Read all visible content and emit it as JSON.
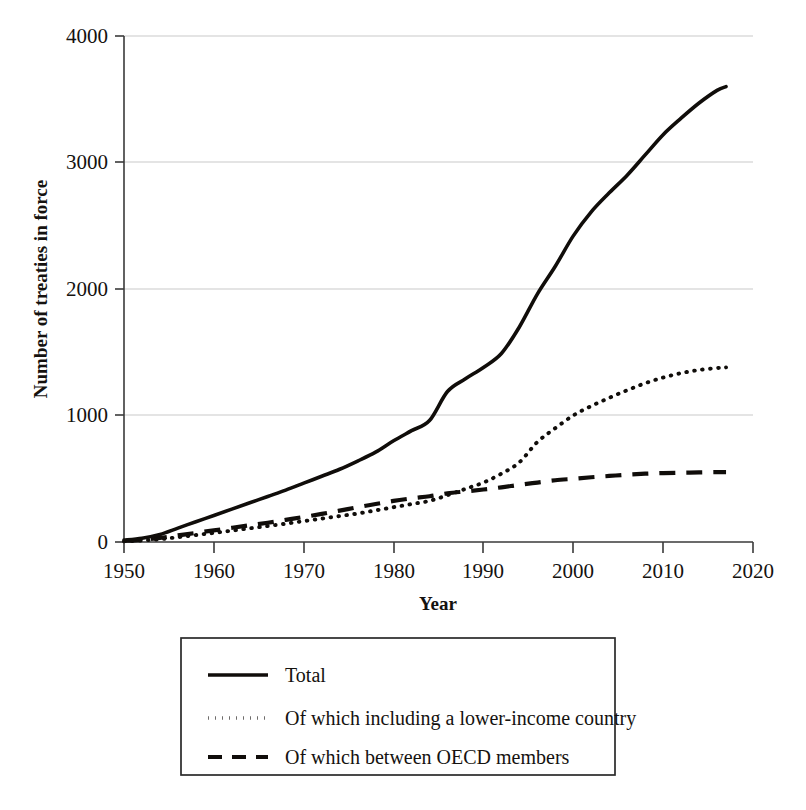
{
  "chart_data": {
    "type": "line",
    "title": "",
    "xlabel": "Year",
    "ylabel": "Number of treaties in force",
    "xlim": [
      1950,
      2020
    ],
    "ylim": [
      0,
      4000
    ],
    "xticks": [
      "1950",
      "1960",
      "1970",
      "1980",
      "1990",
      "2000",
      "2010",
      "2020"
    ],
    "yticks": [
      "0",
      "1000",
      "2000",
      "3000",
      "4000"
    ],
    "grid": "horizontal",
    "legend_position": "below-plot",
    "x": [
      1950,
      1952,
      1954,
      1956,
      1958,
      1960,
      1962,
      1964,
      1966,
      1968,
      1970,
      1972,
      1974,
      1976,
      1978,
      1980,
      1982,
      1984,
      1986,
      1988,
      1990,
      1992,
      1994,
      1996,
      1998,
      2000,
      2002,
      2004,
      2006,
      2008,
      2010,
      2012,
      2014,
      2016,
      2017
    ],
    "series": [
      {
        "name": "Total",
        "style": "solid",
        "values": [
          15,
          30,
          60,
          110,
          160,
          210,
          260,
          310,
          360,
          410,
          465,
          520,
          575,
          640,
          710,
          800,
          880,
          960,
          1190,
          1290,
          1380,
          1490,
          1700,
          1960,
          2180,
          2420,
          2610,
          2760,
          2900,
          3060,
          3220,
          3350,
          3470,
          3570,
          3600
        ]
      },
      {
        "name": "Of which including a lower-income country",
        "style": "dotted",
        "values": [
          5,
          12,
          22,
          38,
          55,
          72,
          90,
          108,
          126,
          145,
          165,
          185,
          205,
          225,
          250,
          275,
          300,
          325,
          370,
          420,
          470,
          540,
          630,
          790,
          900,
          1000,
          1075,
          1140,
          1200,
          1255,
          1300,
          1335,
          1360,
          1375,
          1380
        ]
      },
      {
        "name": "Of which between OECD members",
        "style": "dashed",
        "values": [
          8,
          18,
          32,
          52,
          72,
          92,
          112,
          132,
          152,
          175,
          198,
          222,
          248,
          275,
          300,
          325,
          345,
          362,
          385,
          400,
          415,
          432,
          452,
          470,
          488,
          500,
          512,
          522,
          532,
          540,
          545,
          548,
          550,
          552,
          552
        ]
      }
    ]
  },
  "axes": {
    "y_title": "Number of treaties in force",
    "x_title": "Year",
    "y_ticks": [
      {
        "label": "4000",
        "value": 4000
      },
      {
        "label": "3000",
        "value": 3000
      },
      {
        "label": "2000",
        "value": 2000
      },
      {
        "label": "1000",
        "value": 1000
      },
      {
        "label": "0",
        "value": 0
      }
    ],
    "x_ticks": [
      {
        "label": "1950",
        "value": 1950
      },
      {
        "label": "1960",
        "value": 1960
      },
      {
        "label": "1970",
        "value": 1970
      },
      {
        "label": "1980",
        "value": 1980
      },
      {
        "label": "1990",
        "value": 1990
      },
      {
        "label": "2000",
        "value": 2000
      },
      {
        "label": "2010",
        "value": 2010
      },
      {
        "label": "2020",
        "value": 2020
      }
    ]
  },
  "legend": {
    "entries": [
      {
        "label": "Total",
        "style": "solid"
      },
      {
        "label": "Of which including a lower-income country",
        "style": "dotted"
      },
      {
        "label": "Of which between OECD members",
        "style": "dashed"
      }
    ]
  },
  "colors": {
    "line": "#100d0a",
    "grid": "#c9c9c9",
    "axis": "#3a3a3a",
    "background": "#ffffff"
  }
}
